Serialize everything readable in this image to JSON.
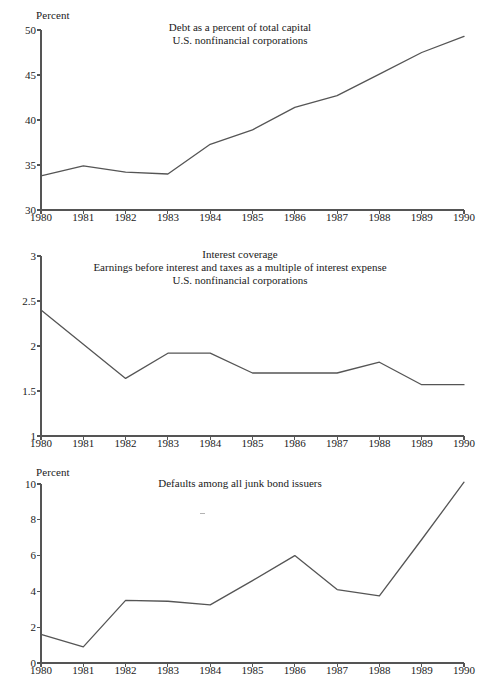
{
  "figure": {
    "line_color": "#555555",
    "axis_color": "#555555",
    "text_color": "#1a1a1a",
    "background": "#ffffff"
  },
  "panels": [
    {
      "unit_label": "Percent",
      "title_lines": [
        "Debt as a percent of total capital",
        "U.S. nonfinancial corporations"
      ]
    },
    {
      "unit_label": "",
      "title_lines": [
        "Interest coverage",
        "Earnings before interest and taxes as a multiple of interest expense",
        "U.S. nonfinancial corporations"
      ]
    },
    {
      "unit_label": "Percent",
      "title_lines": [
        "Defaults among all junk bond issuers"
      ]
    }
  ],
  "chart_data": [
    {
      "type": "line",
      "title": "Debt as a percent of total capital\nU.S. nonfinancial corporations",
      "xlabel": "",
      "ylabel": "Percent",
      "x": [
        1980,
        1981,
        1982,
        1983,
        1984,
        1985,
        1986,
        1987,
        1988,
        1989,
        1990
      ],
      "categories": [
        "1980",
        "1981",
        "1982",
        "1983",
        "1984",
        "1985",
        "1986",
        "1987",
        "1988",
        "1989",
        "1990"
      ],
      "values": [
        33.8,
        34.9,
        34.2,
        34.0,
        37.3,
        38.9,
        41.4,
        42.7,
        45.1,
        47.5,
        49.3
      ],
      "series": [
        {
          "name": "Debt as a percent of total capital",
          "values": [
            33.8,
            34.9,
            34.2,
            34.0,
            37.3,
            38.9,
            41.4,
            42.7,
            45.1,
            47.5,
            49.3
          ]
        }
      ],
      "xlim": [
        1980,
        1990
      ],
      "ylim": [
        30,
        50
      ],
      "yticks": [
        30,
        35,
        40,
        45,
        50
      ],
      "ytick_labels": [
        "30",
        "35",
        "40",
        "45",
        "50"
      ],
      "xticks": [
        1980,
        1981,
        1982,
        1983,
        1984,
        1985,
        1986,
        1987,
        1988,
        1989,
        1990
      ],
      "xtick_labels": [
        "1980",
        "1981",
        "1982",
        "1983",
        "1984",
        "1985",
        "1986",
        "1987",
        "1988",
        "1989",
        "1990"
      ],
      "grid": false,
      "legend": "none"
    },
    {
      "type": "line",
      "title": "Interest coverage\nEarnings before interest and taxes as a multiple of interest expense\nU.S. nonfinancial corporations",
      "xlabel": "",
      "ylabel": "",
      "x": [
        1980,
        1981,
        1982,
        1983,
        1984,
        1985,
        1986,
        1987,
        1988,
        1989,
        1990
      ],
      "categories": [
        "1980",
        "1981",
        "1982",
        "1983",
        "1984",
        "1985",
        "1986",
        "1987",
        "1988",
        "1989",
        "1990"
      ],
      "values": [
        2.4,
        2.02,
        1.64,
        1.92,
        1.92,
        1.7,
        1.7,
        1.7,
        1.82,
        1.57,
        1.57
      ],
      "series": [
        {
          "name": "Interest coverage",
          "values": [
            2.4,
            2.02,
            1.64,
            1.92,
            1.92,
            1.7,
            1.7,
            1.7,
            1.82,
            1.57,
            1.57
          ]
        }
      ],
      "xlim": [
        1980,
        1990
      ],
      "ylim": [
        1,
        3
      ],
      "yticks": [
        1,
        1.5,
        2,
        2.5,
        3
      ],
      "ytick_labels": [
        "1",
        "1.5",
        "2",
        "2.5",
        "3"
      ],
      "xticks": [
        1980,
        1981,
        1982,
        1983,
        1984,
        1985,
        1986,
        1987,
        1988,
        1989,
        1990
      ],
      "xtick_labels": [
        "1980",
        "1981",
        "1982",
        "1983",
        "1984",
        "1985",
        "1986",
        "1987",
        "1988",
        "1989",
        "1990"
      ],
      "grid": false,
      "legend": "none"
    },
    {
      "type": "line",
      "title": "Defaults among all junk bond issuers",
      "xlabel": "",
      "ylabel": "Percent",
      "x": [
        1980,
        1981,
        1982,
        1983,
        1984,
        1985,
        1986,
        1987,
        1988,
        1989,
        1990
      ],
      "categories": [
        "1980",
        "1981",
        "1982",
        "1983",
        "1984",
        "1985",
        "1986",
        "1987",
        "1988",
        "1989",
        "1990"
      ],
      "values": [
        1.6,
        0.9,
        3.5,
        3.45,
        3.25,
        4.6,
        6.0,
        4.1,
        3.75,
        6.9,
        10.1
      ],
      "series": [
        {
          "name": "Defaults among all junk bond issuers",
          "values": [
            1.6,
            0.9,
            3.5,
            3.45,
            3.25,
            4.6,
            6.0,
            4.1,
            3.75,
            6.9,
            10.1
          ]
        }
      ],
      "xlim": [
        1980,
        1990
      ],
      "ylim": [
        0,
        10
      ],
      "yticks": [
        0,
        2,
        4,
        6,
        8,
        10
      ],
      "ytick_labels": [
        "0",
        "2",
        "4",
        "6",
        "8",
        "10"
      ],
      "xticks": [
        1980,
        1981,
        1982,
        1983,
        1984,
        1985,
        1986,
        1987,
        1988,
        1989,
        1990
      ],
      "xtick_labels": [
        "1980",
        "1981",
        "1982",
        "1983",
        "1984",
        "1985",
        "1986",
        "1987",
        "1988",
        "1989",
        "1990"
      ],
      "grid": false,
      "legend": "none"
    }
  ]
}
